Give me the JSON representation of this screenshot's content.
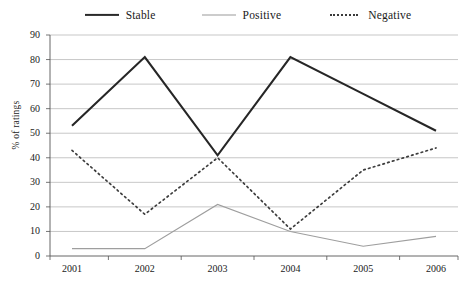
{
  "chart_data": {
    "type": "line",
    "title": "",
    "xlabel": "",
    "ylabel": "% of ratings",
    "categories": [
      "2001",
      "2002",
      "2003",
      "2004",
      "2005",
      "2006"
    ],
    "ylim": [
      0,
      90
    ],
    "ytick_step": 10,
    "yticks": [
      "90",
      "80",
      "70",
      "60",
      "50",
      "40",
      "30",
      "20",
      "10",
      "0"
    ],
    "grid": true,
    "legend_position": "top-center",
    "series": [
      {
        "name": "Stable",
        "style": "solid-thick",
        "color": "#262626",
        "values": [
          53,
          81,
          41,
          81,
          66,
          51
        ]
      },
      {
        "name": "Positive",
        "style": "solid-thin",
        "color": "#9e9e9e",
        "values": [
          3,
          3,
          21,
          10,
          4,
          8
        ]
      },
      {
        "name": "Negative",
        "style": "dotted",
        "color": "#3d3d3d",
        "values": [
          43,
          17,
          40,
          11,
          35,
          44
        ]
      }
    ]
  },
  "legend": {
    "items": [
      {
        "label": "Stable"
      },
      {
        "label": "Positive"
      },
      {
        "label": "Negative"
      }
    ]
  }
}
